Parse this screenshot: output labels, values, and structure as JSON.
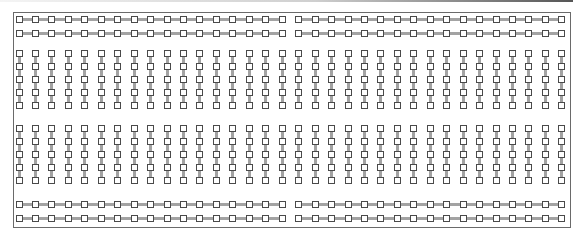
{
  "board": {
    "columns": 34,
    "column_spacing": 16.45,
    "first_column_center_x": 19,
    "hole_size": 7,
    "colors": {
      "hole_border": "#4a4a4a",
      "hole_fill": "#ffffff",
      "connector": "#a3a3a3",
      "board_border": "#6a6a6a"
    },
    "power_rails": {
      "rows_y": [
        19,
        33,
        204,
        218
      ],
      "groups": [
        [
          0,
          16
        ],
        [
          17,
          33
        ]
      ]
    },
    "terminal_strips": {
      "top_rows_y": [
        53,
        66,
        79,
        92,
        105
      ],
      "bottom_rows_y": [
        128,
        141,
        154,
        167,
        180
      ]
    }
  }
}
